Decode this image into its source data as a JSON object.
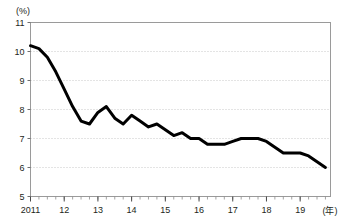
{
  "chart_data": {
    "type": "line",
    "title": "",
    "xlabel": "(年)",
    "ylabel": "(%)",
    "ylim": [
      5,
      11
    ],
    "yticks": [
      5,
      6,
      7,
      8,
      9,
      10,
      11
    ],
    "ytick_labels": [
      "5",
      "6",
      "7",
      "8",
      "9",
      "10",
      "11"
    ],
    "xlim": [
      2011.0,
      2019.9
    ],
    "xticks": [
      2011,
      2012,
      2013,
      2014,
      2015,
      2016,
      2017,
      2018,
      2019
    ],
    "xtick_labels": [
      "2011",
      "12",
      "13",
      "14",
      "15",
      "16",
      "17",
      "18",
      "19"
    ],
    "minor_xticks_per_year": 4,
    "grid": "horizontal-dotted",
    "legend": "none",
    "line_color": "#000000",
    "line_width": 3,
    "series": [
      {
        "name": "",
        "x": [
          2011.0,
          2011.25,
          2011.5,
          2011.75,
          2012.0,
          2012.25,
          2012.5,
          2012.75,
          2013.0,
          2013.25,
          2013.5,
          2013.75,
          2014.0,
          2014.25,
          2014.5,
          2014.75,
          2015.0,
          2015.25,
          2015.5,
          2015.75,
          2016.0,
          2016.25,
          2016.5,
          2016.75,
          2017.0,
          2017.25,
          2017.5,
          2017.75,
          2018.0,
          2018.25,
          2018.5,
          2018.75,
          2019.0,
          2019.25,
          2019.5,
          2019.75
        ],
        "values": [
          10.2,
          10.1,
          9.8,
          9.3,
          8.7,
          8.1,
          7.6,
          7.5,
          7.9,
          8.1,
          7.7,
          7.5,
          7.8,
          7.6,
          7.4,
          7.5,
          7.3,
          7.1,
          7.2,
          7.0,
          7.0,
          6.8,
          6.8,
          6.8,
          6.9,
          7.0,
          7.0,
          7.0,
          6.9,
          6.7,
          6.5,
          6.5,
          6.5,
          6.4,
          6.2,
          6.0
        ]
      }
    ]
  },
  "axis": {
    "y_unit": "(%)",
    "x_unit": "(年)"
  }
}
